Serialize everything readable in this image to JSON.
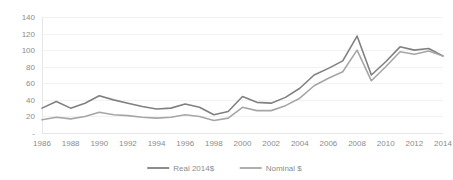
{
  "chart_data": {
    "type": "line",
    "title": "",
    "subtitle": "",
    "xlabel": "",
    "ylabel": "",
    "x": [
      1986,
      1987,
      1988,
      1989,
      1990,
      1991,
      1992,
      1993,
      1994,
      1995,
      1996,
      1997,
      1998,
      1999,
      2000,
      2001,
      2002,
      2003,
      2004,
      2005,
      2006,
      2007,
      2008,
      2009,
      2010,
      2011,
      2012,
      2013,
      2014
    ],
    "xlim": [
      1986,
      2014
    ],
    "ylim": [
      0,
      140
    ],
    "ytick_values": [
      0,
      20,
      40,
      60,
      80,
      100,
      120,
      140
    ],
    "ytick_labels": [
      "-",
      "20",
      "40",
      "60",
      "80",
      "100",
      "120",
      "140"
    ],
    "xtick_values": [
      1986,
      1988,
      1990,
      1992,
      1994,
      1996,
      1998,
      2000,
      2002,
      2004,
      2006,
      2008,
      2010,
      2012,
      2014
    ],
    "xtick_labels": [
      "1986",
      "1988",
      "1990",
      "1992",
      "1994",
      "1996",
      "1998",
      "2000",
      "2002",
      "2004",
      "2006",
      "2008",
      "2010",
      "2012",
      "2014"
    ],
    "grid": true,
    "grid_axis": "y",
    "legend_position": "bottom-center",
    "series": [
      {
        "name": "Real 2014$",
        "color": "#808080",
        "values": [
          30,
          38,
          30,
          36,
          45,
          40,
          36,
          32,
          29,
          30,
          35,
          31,
          22,
          26,
          44,
          37,
          36,
          43,
          54,
          70,
          78,
          87,
          117,
          70,
          86,
          104,
          100,
          102,
          93
        ]
      },
      {
        "name": "Nominal $",
        "color": "#a6a6a6",
        "values": [
          16,
          19,
          17,
          20,
          25,
          22,
          21,
          19,
          18,
          19,
          22,
          20,
          15,
          18,
          31,
          27,
          27,
          33,
          42,
          57,
          66,
          74,
          100,
          63,
          80,
          98,
          95,
          99,
          93
        ]
      }
    ]
  },
  "legend": {
    "items": [
      {
        "label": "Real 2014$",
        "color": "#808080"
      },
      {
        "label": "Nominal $",
        "color": "#a6a6a6"
      }
    ]
  },
  "colors": {
    "gridline": "#f2f2f2",
    "axis": "#e6e6e6",
    "tick_text": "#8c8c8c",
    "background": "#ffffff"
  }
}
